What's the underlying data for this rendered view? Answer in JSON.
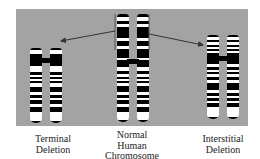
{
  "figure": {
    "background_color": "#a3a3a3",
    "band_color": "#000000",
    "light_band_color": "#ffffff",
    "arrow_color": "#333333"
  },
  "labels": {
    "terminal": [
      "Terminal",
      "Deletion"
    ],
    "normal": [
      "Normal",
      "Human",
      "Chromosome"
    ],
    "interstitial": [
      "Interstitial",
      "Deletion"
    ]
  },
  "chromosomes": [
    {
      "id": "terminal-deletion",
      "name": "Terminal Deletion",
      "left": 30,
      "top": 48,
      "height": 75,
      "centromere_y": 12,
      "dark_bands": [
        [
          0,
          2
        ],
        [
          6,
          18
        ],
        [
          24,
          27
        ],
        [
          29,
          31
        ],
        [
          33,
          35
        ],
        [
          39,
          44
        ],
        [
          47,
          50
        ],
        [
          52,
          56
        ],
        [
          59,
          64
        ],
        [
          73,
          75
        ]
      ]
    },
    {
      "id": "normal",
      "name": "Normal Human Chromosome",
      "left": 117,
      "top": 14,
      "height": 108,
      "centromere_y": 47,
      "dark_bands": [
        [
          0,
          3
        ],
        [
          7,
          10
        ],
        [
          13,
          24
        ],
        [
          27,
          32
        ],
        [
          35,
          44
        ],
        [
          46,
          53
        ],
        [
          57,
          60
        ],
        [
          63,
          65
        ],
        [
          67,
          69
        ],
        [
          72,
          78
        ],
        [
          81,
          84
        ],
        [
          86,
          90
        ],
        [
          93,
          98
        ],
        [
          106,
          108
        ]
      ]
    },
    {
      "id": "interstitial-deletion",
      "name": "Interstitial Deletion",
      "left": 207,
      "top": 35,
      "height": 84,
      "centromere_y": 23,
      "dark_bands": [
        [
          0,
          2
        ],
        [
          5,
          7
        ],
        [
          10,
          12
        ],
        [
          14,
          16
        ],
        [
          18,
          29
        ],
        [
          32,
          35
        ],
        [
          37,
          39
        ],
        [
          42,
          45
        ],
        [
          48,
          55
        ],
        [
          58,
          61
        ],
        [
          63,
          66
        ],
        [
          68,
          72
        ],
        [
          82,
          84
        ]
      ]
    }
  ],
  "annotations": {
    "bracket_top": 14,
    "bracket_bottom": 50,
    "bracket_left_x": 115,
    "bracket_right_x": 149,
    "arrow_left": {
      "from": [
        115,
        31
      ],
      "to": [
        61,
        41
      ]
    },
    "arrow_right": {
      "from": [
        149,
        34
      ],
      "to": [
        203,
        45
      ]
    }
  }
}
